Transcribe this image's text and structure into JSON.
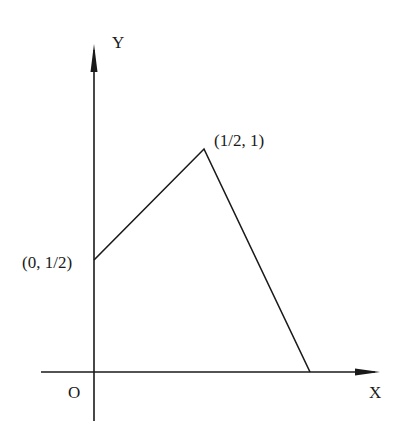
{
  "diagram": {
    "type": "piecewise-linear-graph",
    "axes": {
      "x_label": "X",
      "y_label": "Y",
      "origin_label": "O"
    },
    "points": [
      {
        "label": "(0, 1/2)",
        "x": 0,
        "y": 0.5
      },
      {
        "label": "(1/2, 1)",
        "x": 0.5,
        "y": 1
      },
      {
        "label": "",
        "x": 1,
        "y": 0
      }
    ],
    "segments": [
      {
        "from": "(0, 1/2)",
        "to": "(1/2, 1)"
      },
      {
        "from": "(1/2, 1)",
        "to": "x-intercept"
      }
    ],
    "colors": {
      "stroke": "#1a1a1a",
      "background": "#ffffff"
    }
  }
}
